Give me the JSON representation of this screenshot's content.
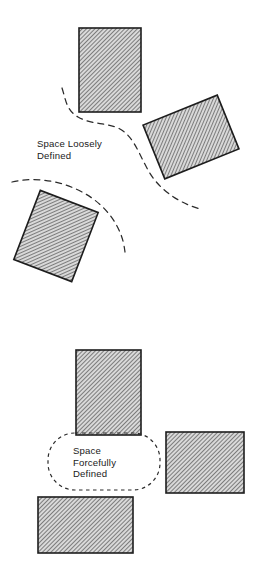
{
  "figure": {
    "background_color": "#ffffff",
    "ink_color": "#1d1d1d",
    "hatch_color": "#3a3a3a",
    "hatch_fill_color": "#cfcfcf"
  },
  "panels": [
    {
      "id": "loose",
      "caption_lines": [
        "Space Loosely",
        "Defined"
      ],
      "caption_x": 37,
      "caption_y": 147,
      "caption_line_height": 11.5,
      "masses": [
        {
          "name": "upright-block-top",
          "x": 79,
          "y": 28,
          "width": 62,
          "height": 84,
          "rotation": 0
        },
        {
          "name": "tilted-block-right",
          "x": 151,
          "y": 108,
          "width": 80,
          "height": 58,
          "rotation": -22
        },
        {
          "name": "tilted-block-lower-left",
          "x": 25,
          "y": 199,
          "width": 62,
          "height": 74,
          "rotation": 21
        }
      ],
      "boundaries": [
        {
          "name": "upper-boundary-curve",
          "path": "M 62 88 C 66 100 66 110 78 117 C 92 125 104 122 118 128 C 133 135 138 152 148 170 C 158 188 176 202 200 209"
        },
        {
          "name": "lower-boundary-curve",
          "path": "M 12 182 C 34 177 56 180 76 189 C 96 198 110 212 118 228 C 123 238 124 245 125 252"
        }
      ]
    },
    {
      "id": "forceful",
      "caption_lines": [
        "Space",
        "Forcefully",
        "Defined"
      ],
      "caption_x": 73,
      "caption_y": 454,
      "caption_line_height": 11.5,
      "masses": [
        {
          "name": "upright-block-top",
          "x": 76,
          "y": 350,
          "width": 65,
          "height": 85,
          "rotation": 0
        },
        {
          "name": "upright-block-right",
          "x": 166,
          "y": 432,
          "width": 78,
          "height": 61,
          "rotation": 0
        },
        {
          "name": "upright-block-bottom",
          "x": 38,
          "y": 497,
          "width": 95,
          "height": 56,
          "rotation": 0
        }
      ],
      "enclosure": {
        "name": "defined-space-outline",
        "x": 48,
        "y": 433,
        "width": 112,
        "height": 57,
        "corner_radius": 27
      }
    }
  ]
}
